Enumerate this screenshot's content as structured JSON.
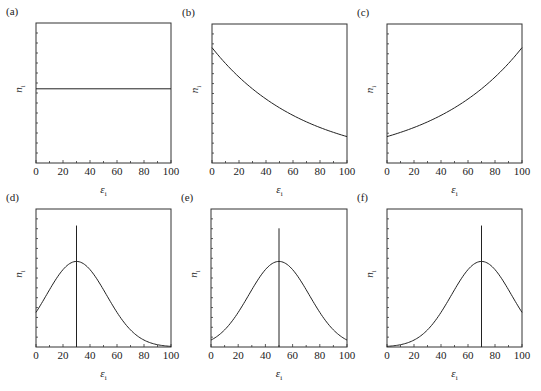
{
  "figure": {
    "panels": [
      {
        "label": "(a)",
        "xlabel": "ε",
        "xlabel_sub": "i",
        "ylabel": "n",
        "ylabel_sub": "i"
      },
      {
        "label": "(b)",
        "xlabel": "ε",
        "xlabel_sub": "i",
        "ylabel": "n",
        "ylabel_sub": "i"
      },
      {
        "label": "(c)",
        "xlabel": "ε",
        "xlabel_sub": "i",
        "ylabel": "n",
        "ylabel_sub": "i"
      },
      {
        "label": "(d)",
        "xlabel": "ε",
        "xlabel_sub": "i",
        "ylabel": "n",
        "ylabel_sub": "i"
      },
      {
        "label": "(e)",
        "xlabel": "ε",
        "xlabel_sub": "i",
        "ylabel": "n",
        "ylabel_sub": "i"
      },
      {
        "label": "(f)",
        "xlabel": "ε",
        "xlabel_sub": "i",
        "ylabel": "n",
        "ylabel_sub": "i"
      }
    ],
    "x_ticks": [
      "0",
      "20",
      "40",
      "60",
      "80",
      "100"
    ]
  },
  "chart_data": [
    {
      "panel": "(a)",
      "type": "line",
      "title": "(a)",
      "xlabel": "ε_i",
      "ylabel": "n_i",
      "xlim": [
        0,
        100
      ],
      "ylim": [
        0,
        1
      ],
      "x": [
        0,
        100
      ],
      "values": [
        0.53,
        0.53
      ],
      "description": "constant (uniform) distribution"
    },
    {
      "panel": "(b)",
      "type": "line",
      "title": "(b)",
      "xlabel": "ε_i",
      "ylabel": "n_i",
      "xlim": [
        0,
        100
      ],
      "ylim": [
        0,
        1
      ],
      "x": [
        0,
        20,
        40,
        60,
        80,
        100
      ],
      "values": [
        0.83,
        0.66,
        0.51,
        0.38,
        0.28,
        0.19
      ],
      "description": "decreasing curve"
    },
    {
      "panel": "(c)",
      "type": "line",
      "title": "(c)",
      "xlabel": "ε_i",
      "ylabel": "n_i",
      "xlim": [
        0,
        100
      ],
      "ylim": [
        0,
        1
      ],
      "x": [
        0,
        20,
        40,
        60,
        80,
        100
      ],
      "values": [
        0.19,
        0.28,
        0.38,
        0.51,
        0.66,
        0.83
      ],
      "description": "increasing curve"
    },
    {
      "panel": "(d)",
      "type": "line",
      "title": "(d)",
      "xlabel": "ε_i",
      "ylabel": "n_i",
      "xlim": [
        0,
        100
      ],
      "ylim": [
        0,
        1
      ],
      "gaussian": {
        "center": 30,
        "peak": 0.62,
        "sigma": 22.3
      },
      "vline": {
        "x": 30,
        "top": 0.88
      },
      "x": [
        0,
        20,
        30,
        40,
        60,
        80,
        100
      ],
      "values": [
        0.25,
        0.56,
        0.62,
        0.56,
        0.25,
        0.05,
        0.0
      ]
    },
    {
      "panel": "(e)",
      "type": "line",
      "title": "(e)",
      "xlabel": "ε_i",
      "ylabel": "n_i",
      "xlim": [
        0,
        100
      ],
      "ylim": [
        0,
        1
      ],
      "gaussian": {
        "center": 50,
        "peak": 0.62,
        "sigma": 22.3
      },
      "vline": {
        "x": 50,
        "top": 0.86
      },
      "x": [
        0,
        20,
        40,
        50,
        60,
        80,
        100
      ],
      "values": [
        0.05,
        0.25,
        0.56,
        0.62,
        0.56,
        0.25,
        0.05
      ]
    },
    {
      "panel": "(f)",
      "type": "line",
      "title": "(f)",
      "xlabel": "ε_i",
      "ylabel": "n_i",
      "xlim": [
        0,
        100
      ],
      "ylim": [
        0,
        1
      ],
      "gaussian": {
        "center": 70,
        "peak": 0.62,
        "sigma": 22.3
      },
      "vline": {
        "x": 70,
        "top": 0.88
      },
      "x": [
        0,
        20,
        40,
        60,
        70,
        80,
        100
      ],
      "values": [
        0.0,
        0.05,
        0.25,
        0.56,
        0.62,
        0.56,
        0.25
      ]
    }
  ]
}
